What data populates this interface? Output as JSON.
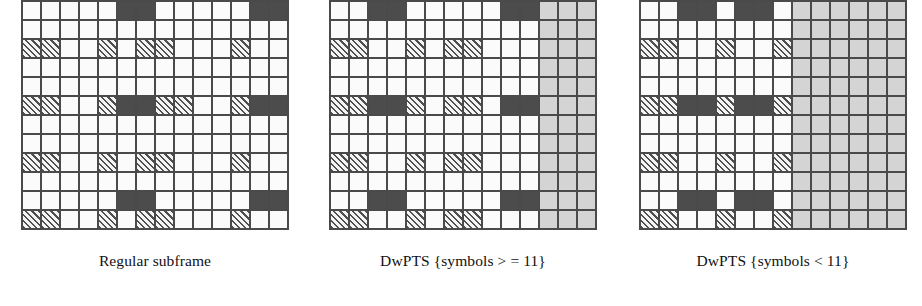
{
  "figure": {
    "grid_dimensions": {
      "columns": 14,
      "rows": 12
    },
    "legend_colors": {
      "empty_resource_element": "#fbfbfb",
      "control_region_dark": "#4c4c4c",
      "reference_signal_hatched": "#f2f2f2",
      "unused_guard_gray": "#d4d4d4",
      "grid_line": "#4a4a4a"
    }
  },
  "panels": [
    {
      "id": "regular-subframe",
      "caption": "Regular subframe",
      "columns": 14,
      "rows": 12,
      "grayed_columns": [],
      "cells": [
        [
          "white",
          "white",
          "white",
          "white",
          "white",
          "dark",
          "dark",
          "white",
          "white",
          "white",
          "white",
          "white",
          "dark",
          "dark"
        ],
        [
          "white",
          "white",
          "white",
          "white",
          "white",
          "white",
          "white",
          "white",
          "white",
          "white",
          "white",
          "white",
          "white",
          "white"
        ],
        [
          "hatch",
          "hatch",
          "white",
          "white",
          "hatch",
          "white",
          "hatch",
          "hatch",
          "white",
          "white",
          "white",
          "hatch",
          "white",
          "white"
        ],
        [
          "white",
          "white",
          "white",
          "white",
          "white",
          "white",
          "white",
          "white",
          "white",
          "white",
          "white",
          "white",
          "white",
          "white"
        ],
        [
          "white",
          "white",
          "white",
          "white",
          "white",
          "white",
          "white",
          "white",
          "white",
          "white",
          "white",
          "white",
          "white",
          "white"
        ],
        [
          "hatch",
          "hatch",
          "white",
          "white",
          "hatch",
          "dark",
          "dark",
          "hatch",
          "hatch",
          "white",
          "white",
          "hatch",
          "dark",
          "dark"
        ],
        [
          "white",
          "white",
          "white",
          "white",
          "white",
          "white",
          "white",
          "white",
          "white",
          "white",
          "white",
          "white",
          "white",
          "white"
        ],
        [
          "white",
          "white",
          "white",
          "white",
          "white",
          "white",
          "white",
          "white",
          "white",
          "white",
          "white",
          "white",
          "white",
          "white"
        ],
        [
          "hatch",
          "hatch",
          "white",
          "white",
          "hatch",
          "white",
          "hatch",
          "hatch",
          "white",
          "white",
          "white",
          "hatch",
          "white",
          "white"
        ],
        [
          "white",
          "white",
          "white",
          "white",
          "white",
          "white",
          "white",
          "white",
          "white",
          "white",
          "white",
          "white",
          "white",
          "white"
        ],
        [
          "white",
          "white",
          "white",
          "white",
          "white",
          "dark",
          "dark",
          "white",
          "white",
          "white",
          "white",
          "white",
          "dark",
          "dark"
        ],
        [
          "hatch",
          "hatch",
          "white",
          "white",
          "hatch",
          "white",
          "hatch",
          "hatch",
          "white",
          "white",
          "white",
          "hatch",
          "white",
          "white"
        ]
      ]
    },
    {
      "id": "dwpts-symbols-ge-11",
      "caption": "DwPTS {symbols > = 11}",
      "columns": 14,
      "rows": 12,
      "grayed_columns": [
        11,
        12,
        13
      ],
      "cells": [
        [
          "white",
          "white",
          "dark",
          "dark",
          "white",
          "white",
          "white",
          "white",
          "white",
          "dark",
          "dark",
          "gray",
          "gray",
          "gray"
        ],
        [
          "white",
          "white",
          "white",
          "white",
          "white",
          "white",
          "white",
          "white",
          "white",
          "white",
          "white",
          "gray",
          "gray",
          "gray"
        ],
        [
          "hatch",
          "hatch",
          "white",
          "white",
          "hatch",
          "white",
          "hatch",
          "hatch",
          "white",
          "white",
          "white",
          "gray",
          "gray",
          "gray"
        ],
        [
          "white",
          "white",
          "white",
          "white",
          "white",
          "white",
          "white",
          "white",
          "white",
          "white",
          "white",
          "gray",
          "gray",
          "gray"
        ],
        [
          "white",
          "white",
          "white",
          "white",
          "white",
          "white",
          "white",
          "white",
          "white",
          "white",
          "white",
          "gray",
          "gray",
          "gray"
        ],
        [
          "hatch",
          "hatch",
          "dark",
          "dark",
          "hatch",
          "white",
          "hatch",
          "hatch",
          "white",
          "dark",
          "dark",
          "gray",
          "gray",
          "gray"
        ],
        [
          "white",
          "white",
          "white",
          "white",
          "white",
          "white",
          "white",
          "white",
          "white",
          "white",
          "white",
          "gray",
          "gray",
          "gray"
        ],
        [
          "white",
          "white",
          "white",
          "white",
          "white",
          "white",
          "white",
          "white",
          "white",
          "white",
          "white",
          "gray",
          "gray",
          "gray"
        ],
        [
          "hatch",
          "hatch",
          "white",
          "white",
          "hatch",
          "white",
          "hatch",
          "hatch",
          "white",
          "white",
          "white",
          "gray",
          "gray",
          "gray"
        ],
        [
          "white",
          "white",
          "white",
          "white",
          "white",
          "white",
          "white",
          "white",
          "white",
          "white",
          "white",
          "gray",
          "gray",
          "gray"
        ],
        [
          "white",
          "white",
          "dark",
          "dark",
          "white",
          "white",
          "white",
          "white",
          "white",
          "dark",
          "dark",
          "gray",
          "gray",
          "gray"
        ],
        [
          "hatch",
          "hatch",
          "white",
          "white",
          "hatch",
          "white",
          "hatch",
          "hatch",
          "white",
          "white",
          "white",
          "gray",
          "gray",
          "gray"
        ]
      ]
    },
    {
      "id": "dwpts-symbols-lt-11",
      "caption": "DwPTS {symbols < 11}",
      "columns": 14,
      "rows": 12,
      "grayed_columns": [
        8,
        9,
        10,
        11,
        12,
        13
      ],
      "cells": [
        [
          "white",
          "white",
          "dark",
          "dark",
          "white",
          "dark",
          "dark",
          "white",
          "gray",
          "gray",
          "gray",
          "gray",
          "gray",
          "gray"
        ],
        [
          "white",
          "white",
          "white",
          "white",
          "white",
          "white",
          "white",
          "white",
          "gray",
          "gray",
          "gray",
          "gray",
          "gray",
          "gray"
        ],
        [
          "hatch",
          "hatch",
          "white",
          "white",
          "hatch",
          "white",
          "white",
          "hatch",
          "gray",
          "gray",
          "gray",
          "gray",
          "gray",
          "gray"
        ],
        [
          "white",
          "white",
          "white",
          "white",
          "white",
          "white",
          "white",
          "white",
          "gray",
          "gray",
          "gray",
          "gray",
          "gray",
          "gray"
        ],
        [
          "white",
          "white",
          "white",
          "white",
          "white",
          "white",
          "white",
          "white",
          "gray",
          "gray",
          "gray",
          "gray",
          "gray",
          "gray"
        ],
        [
          "hatch",
          "hatch",
          "dark",
          "dark",
          "hatch",
          "dark",
          "dark",
          "hatch",
          "gray",
          "gray",
          "gray",
          "gray",
          "gray",
          "gray"
        ],
        [
          "white",
          "white",
          "white",
          "white",
          "white",
          "white",
          "white",
          "white",
          "gray",
          "gray",
          "gray",
          "gray",
          "gray",
          "gray"
        ],
        [
          "white",
          "white",
          "white",
          "white",
          "white",
          "white",
          "white",
          "white",
          "gray",
          "gray",
          "gray",
          "gray",
          "gray",
          "gray"
        ],
        [
          "hatch",
          "hatch",
          "white",
          "white",
          "hatch",
          "white",
          "white",
          "hatch",
          "gray",
          "gray",
          "gray",
          "gray",
          "gray",
          "gray"
        ],
        [
          "white",
          "white",
          "white",
          "white",
          "white",
          "white",
          "white",
          "white",
          "gray",
          "gray",
          "gray",
          "gray",
          "gray",
          "gray"
        ],
        [
          "white",
          "white",
          "dark",
          "dark",
          "white",
          "dark",
          "dark",
          "white",
          "gray",
          "gray",
          "gray",
          "gray",
          "gray",
          "gray"
        ],
        [
          "hatch",
          "hatch",
          "white",
          "white",
          "hatch",
          "white",
          "white",
          "hatch",
          "gray",
          "gray",
          "gray",
          "gray",
          "gray",
          "gray"
        ]
      ]
    }
  ]
}
